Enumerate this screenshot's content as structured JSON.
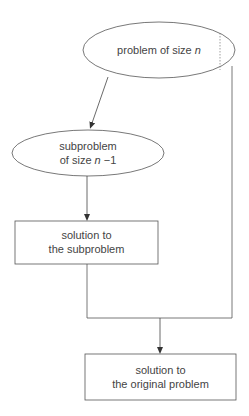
{
  "diagram": {
    "type": "flowchart",
    "nodes": {
      "problem": {
        "text": "problem of size ",
        "var": "n",
        "shape": "ellipse"
      },
      "subproblem": {
        "line1": "subproblem",
        "line2_prefix": "of size ",
        "line2_var": "n",
        "line2_suffix": " −1",
        "shape": "ellipse"
      },
      "sub_solution": {
        "line1": "solution to",
        "line2": "the subproblem",
        "shape": "rectangle"
      },
      "final_solution": {
        "line1": "solution to",
        "line2": "the original problem",
        "shape": "rectangle"
      }
    },
    "edges": [
      {
        "from": "problem",
        "to": "subproblem",
        "arrow": true
      },
      {
        "from": "subproblem",
        "to": "sub_solution",
        "arrow": true
      },
      {
        "from": "sub_solution",
        "to": "final_solution",
        "arrow": true,
        "merge": true
      },
      {
        "from": "problem",
        "to": "final_solution",
        "arrow": true,
        "merge": true
      }
    ],
    "colors": {
      "stroke": "#555555",
      "text": "#444444",
      "background": "#ffffff"
    }
  }
}
